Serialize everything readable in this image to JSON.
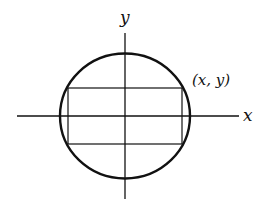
{
  "diagram": {
    "axes": {
      "x_label": "x",
      "y_label": "y"
    },
    "point_label": "(x, y)",
    "colors": {
      "stroke": "#111111",
      "background": "#ffffff"
    }
  }
}
